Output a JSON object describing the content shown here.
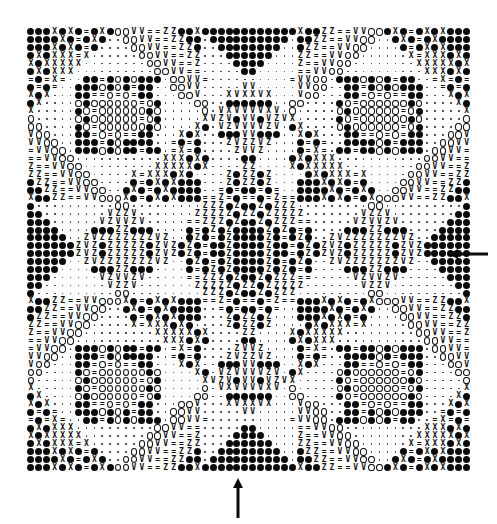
{
  "figure": {
    "glyph_legend": {
      "B": "filled-circle",
      "o": "open-circle",
      ".": "small-dot",
      "X": "X",
      "=": "equals",
      "V": "V",
      "Z": "Z"
    },
    "columns": 56,
    "rows": 56,
    "quadrant_top_left": [
      "BBBXBXB=BXBooVV==ZZBBXBBBBBB",
      "BBBBXB=BXB..ooVV==ZZBB.BBBBB",
      "BBBXBXB=B....ooVV==ZZB..BBBB",
      "BXBXXX=X......ooVV==ZZ...BBB",
      "XBXXXXX........ooVV==Z....BB",
      "BXBXXX..........ooVV==.....B",
      "=B=X=..BB=BoBoBBB.ooVV=.....",
      "B=B=..BBBoBoB=BB..ooVV.....V",
      "XBX...BB==o=o=BB...ooV...XVX",
      "BX....oBoooooo=oB....oo..BBB",
      "X.....Bo=ooooooBo.....o.VXVV",
      "o.....oBoooooo=oB.....XVZVBV",
      "oo....Bo=ooooooBo....XB.VZVV",
      "Voo...BB=o=o==BB...XBX..BBBV",
      "VVoo..BBB=BoBBBB..=B=B...ZVZ",
      "=VVoo.BBBoBoBB=BB.=X=B....ZV",
      "==VVoo...........XXXBXB....B",
      "Z==VVoo.........XXXXXBX....Z",
      "ZZ==VVoo.....X=XXXBXB....ZBZ",
      "BZZ==VVoo....B=BXBXBBB...ZBZ",
      "BBZZ==VVoo..BXB=BXBBBB..=B=B",
      "XBBZZ==VVoooXB=BXBXBBB==Z=B=",
      "B..........oo.........ZZZBZB",
      "BB........VZZV.......ZZZZZBZ",
      "BBB......VZVVZV.....==ZZZBZB",
      "BBBB....BBBZZBBB....B=BZBZBB",
      "BBBBB..ZVZZZZZZZVZ..BZB=BZBB",
      "BBBBBBZVZBZZZZZBZVZBZB=BBZBB"
    ]
  },
  "annotations": {
    "arrow_right": {
      "direction": "left-pointing",
      "position": "right edge, vertical center"
    },
    "arrow_bottom": {
      "direction": "up-pointing",
      "position": "bottom edge, horizontal center"
    }
  },
  "colors": {
    "ink": "#0a0a0a",
    "background": "#ffffff"
  }
}
